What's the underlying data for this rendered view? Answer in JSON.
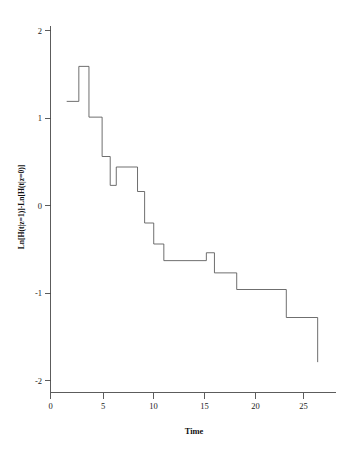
{
  "chart_data": {
    "type": "line",
    "subtype": "step-function",
    "title": "",
    "xlabel": "Time",
    "ylabel": "Ln[H(t|z=1)]-Ln[H(t|z=0)]",
    "xlim": [
      -0.6,
      28.4
    ],
    "ylim": [
      -2.2,
      2.25
    ],
    "xticks": [
      0,
      5,
      10,
      15,
      20,
      25
    ],
    "xticklabels": [
      "0",
      "5",
      "10",
      "15",
      "20",
      "25"
    ],
    "yticks": [
      2,
      1,
      0,
      -1,
      -2
    ],
    "yticklabels": [
      "2",
      "1",
      "0",
      "-1",
      "-2"
    ],
    "grid": false,
    "legend": false,
    "legend_position": "none",
    "series": [
      {
        "name": "Ln[H(t|z=1)]-Ln[H(t|z=0)]",
        "color": "#555555",
        "step": "post",
        "x": [
          1.6,
          2.8,
          2.8,
          3.8,
          3.8,
          5.1,
          5.1,
          5.9,
          5.9,
          6.5,
          6.5,
          8.6,
          8.6,
          9.3,
          9.3,
          10.2,
          10.2,
          11.2,
          11.2,
          15.4,
          15.4,
          16.2,
          16.2,
          18.4,
          18.4,
          23.3,
          23.3,
          26.4,
          26.4
        ],
        "y": [
          1.19,
          1.19,
          1.59,
          1.59,
          1.01,
          1.01,
          0.56,
          0.56,
          0.23,
          0.23,
          0.44,
          0.44,
          0.16,
          0.16,
          -0.2,
          -0.2,
          -0.44,
          -0.44,
          -0.63,
          -0.63,
          -0.54,
          -0.54,
          -0.77,
          -0.77,
          -0.96,
          -0.96,
          -1.28,
          -1.28,
          -1.79
        ]
      }
    ],
    "vertices": [
      {
        "t": 1.6,
        "v": 1.19
      },
      {
        "t": 2.8,
        "v": 1.59
      },
      {
        "t": 3.8,
        "v": 1.01
      },
      {
        "t": 5.1,
        "v": 0.56
      },
      {
        "t": 5.9,
        "v": 0.23
      },
      {
        "t": 6.5,
        "v": 0.44
      },
      {
        "t": 8.6,
        "v": 0.16
      },
      {
        "t": 9.3,
        "v": -0.2
      },
      {
        "t": 10.2,
        "v": -0.44
      },
      {
        "t": 11.2,
        "v": -0.63
      },
      {
        "t": 15.4,
        "v": -0.54
      },
      {
        "t": 16.2,
        "v": -0.77
      },
      {
        "t": 18.4,
        "v": -0.96
      },
      {
        "t": 23.3,
        "v": -1.28
      },
      {
        "t": 26.4,
        "v": -1.79
      }
    ]
  },
  "axes": {
    "x_axis_name": "Time",
    "y_axis_name": "Ln[H(t|z=1)]-Ln[H(t|z=0)]"
  }
}
